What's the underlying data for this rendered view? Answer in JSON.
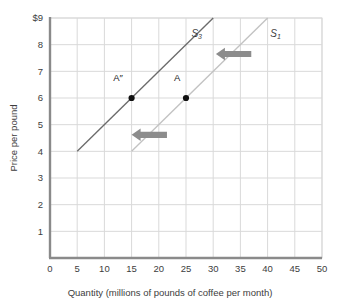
{
  "chart_data": {
    "type": "line",
    "title": "",
    "xlabel": "Quantity (millions of pounds of coffee per month)",
    "ylabel": "Price per pound",
    "xlim": [
      0,
      50
    ],
    "ylim": [
      0,
      9
    ],
    "xticks": [
      "0",
      "5",
      "10",
      "15",
      "20",
      "25",
      "30",
      "35",
      "40",
      "45",
      "50"
    ],
    "yticks": [
      "",
      "1",
      "2",
      "3",
      "4",
      "5",
      "6",
      "7",
      "8",
      "$9"
    ],
    "ytick_values": [
      0,
      1,
      2,
      3,
      4,
      5,
      6,
      7,
      8,
      9
    ],
    "xtick_values": [
      0,
      5,
      10,
      15,
      20,
      25,
      30,
      35,
      40,
      45,
      50
    ],
    "grid": true,
    "legend": "none",
    "series": [
      {
        "name": "S3",
        "label": "S",
        "subscript": "3",
        "color": "#6b6b6b",
        "x": [
          5,
          30
        ],
        "y": [
          4,
          9
        ],
        "label_x": 26,
        "label_y": 8.3
      },
      {
        "name": "S1",
        "label": "S",
        "subscript": "1",
        "color": "#c2c2c2",
        "x": [
          15,
          40
        ],
        "y": [
          4,
          9
        ],
        "label_x": 40.5,
        "label_y": 8.3
      }
    ],
    "points": [
      {
        "name": "A-double-prime",
        "label": "A″",
        "x": 15,
        "y": 6,
        "color": "#111111",
        "label_offset_x": -2.5,
        "label_offset_y": 0.62
      },
      {
        "name": "A",
        "label": "A",
        "x": 25,
        "y": 6,
        "color": "#111111",
        "label_offset_x": -1.6,
        "label_offset_y": 0.62
      }
    ],
    "annotations": [
      {
        "name": "shift-arrow-upper",
        "type": "arrow",
        "direction": "left",
        "color": "#8c8c8c",
        "x_from": 37,
        "x_to": 30.5,
        "y": 7.65
      },
      {
        "name": "shift-arrow-lower",
        "type": "arrow",
        "direction": "left",
        "color": "#8c8c8c",
        "x_from": 21.5,
        "x_to": 15,
        "y": 4.62
      }
    ],
    "colors": {
      "grid": "#d9d9d9",
      "axis": "#8a8a8a",
      "plot_background": "#ffffff",
      "text": "#3d3d3d"
    }
  }
}
